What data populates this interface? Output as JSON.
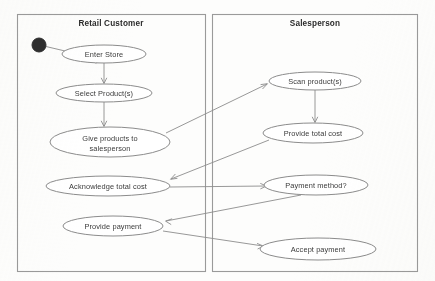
{
  "diagram": {
    "type": "uml-activity-diagram",
    "canvas": {
      "width": 435,
      "height": 281
    },
    "colors": {
      "background": "#fdfdfc",
      "stroke": "#8c8c8c",
      "lane_stroke": "#9a9a9a",
      "text": "#3a3a3a",
      "title_text": "#2b2b2b",
      "initial_node": "#2e2e2e"
    },
    "lanes": [
      {
        "id": "lane-retail-customer",
        "title": "Retail Customer",
        "x": 17,
        "y": 14,
        "width": 189,
        "height": 258,
        "title_x": 111,
        "title_y": 26
      },
      {
        "id": "lane-salesperson",
        "title": "Salesperson",
        "x": 212,
        "y": 14,
        "width": 206,
        "height": 258,
        "title_x": 315,
        "title_y": 26
      }
    ],
    "initial_node": {
      "id": "initial",
      "name": "start-node",
      "cx": 39,
      "cy": 45,
      "r": 7
    },
    "activities": [
      {
        "id": "enter-store",
        "lane": "lane-retail-customer",
        "label": "Enter Store",
        "label2": "",
        "cx": 104,
        "cy": 54,
        "rx": 42,
        "ry": 9
      },
      {
        "id": "select-products",
        "lane": "lane-retail-customer",
        "label": "Select Product(s)",
        "label2": "",
        "cx": 104,
        "cy": 93,
        "rx": 48,
        "ry": 9
      },
      {
        "id": "give-products",
        "lane": "lane-retail-customer",
        "label": "Give products to",
        "label2": "salesperson",
        "cx": 110,
        "cy": 142,
        "rx": 60,
        "ry": 15
      },
      {
        "id": "acknowledge-cost",
        "lane": "lane-retail-customer",
        "label": "Acknowledge total cost",
        "label2": "",
        "cx": 108,
        "cy": 186,
        "rx": 62,
        "ry": 10
      },
      {
        "id": "provide-payment",
        "lane": "lane-retail-customer",
        "label": "Provide payment",
        "label2": "",
        "cx": 113,
        "cy": 226,
        "rx": 50,
        "ry": 10
      },
      {
        "id": "scan-products",
        "lane": "lane-salesperson",
        "label": "Scan product(s)",
        "label2": "",
        "cx": 315,
        "cy": 81,
        "rx": 46,
        "ry": 9
      },
      {
        "id": "provide-total-cost",
        "lane": "lane-salesperson",
        "label": "Provide total cost",
        "label2": "",
        "cx": 313,
        "cy": 133,
        "rx": 50,
        "ry": 10
      },
      {
        "id": "payment-method",
        "lane": "lane-salesperson",
        "label": "Payment method?",
        "label2": "",
        "cx": 316,
        "cy": 185,
        "rx": 52,
        "ry": 10
      },
      {
        "id": "accept-payment",
        "lane": "lane-salesperson",
        "label": "Accept payment",
        "label2": "",
        "cx": 318,
        "cy": 249,
        "rx": 58,
        "ry": 11
      }
    ],
    "transitions": [
      {
        "id": "t-start-enter",
        "from": "initial",
        "to": "enter-store",
        "points": "46,47 100,60",
        "arrow_at": "100,60",
        "arrow_angle": 14
      },
      {
        "id": "t-enter-select",
        "from": "enter-store",
        "to": "select-products",
        "points": "104,63 104,83",
        "arrow_at": "104,83",
        "arrow_angle": 90
      },
      {
        "id": "t-select-give",
        "from": "select-products",
        "to": "give-products",
        "points": "104,102 104,126",
        "arrow_at": "104,126",
        "arrow_angle": 90
      },
      {
        "id": "t-give-scan",
        "from": "give-products",
        "to": "scan-products",
        "points": "168,133 266,84",
        "arrow_at": "266,84",
        "arrow_angle": -27
      },
      {
        "id": "t-scan-total",
        "from": "scan-products",
        "to": "provide-total-cost",
        "points": "315,90 315,122",
        "arrow_at": "315,122",
        "arrow_angle": 90
      },
      {
        "id": "t-total-acknowledge",
        "from": "provide-total-cost",
        "to": "acknowledge-cost",
        "points": "268,140 172,179",
        "arrow_at": "172,179",
        "arrow_angle": 158
      },
      {
        "id": "t-acknowledge-method",
        "from": "acknowledge-cost",
        "to": "payment-method",
        "points": "170,187 266,186",
        "arrow_at": "266,186",
        "arrow_angle": 0
      },
      {
        "id": "t-method-payment",
        "from": "payment-method",
        "to": "provide-payment",
        "points": "300,195 165,221",
        "arrow_at": "165,221",
        "arrow_angle": 169
      },
      {
        "id": "t-payment-accept",
        "from": "provide-payment",
        "to": "accept-payment",
        "points": "164,231 262,246",
        "arrow_at": "262,246",
        "arrow_angle": 9
      }
    ]
  }
}
